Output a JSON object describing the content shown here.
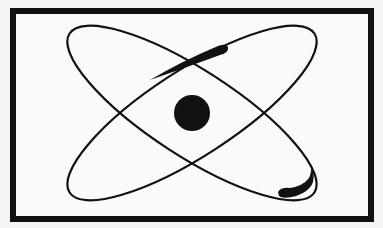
{
  "figure": {
    "title": "Atom symbol",
    "colors": {
      "background": "#f4f4f2",
      "panel": "#fafafa",
      "ink": "#111111"
    },
    "frame": {
      "x": 13,
      "y": 11,
      "width": 358,
      "height": 208,
      "stroke_width": 6
    },
    "nucleus": {
      "cx": 192,
      "cy": 113,
      "r": 18
    },
    "orbits": [
      {
        "name": "orbit-descending",
        "cx": 192,
        "cy": 113,
        "rx": 146,
        "ry": 43,
        "rotation": 33
      },
      {
        "name": "orbit-ascending",
        "cx": 192,
        "cy": 113,
        "rx": 146,
        "ry": 43,
        "rotation": -33
      }
    ],
    "electrons": [
      {
        "name": "electron-top",
        "position": "upper-right on ascending orbit"
      },
      {
        "name": "electron-bottom",
        "position": "lower-right on descending orbit"
      }
    ]
  }
}
